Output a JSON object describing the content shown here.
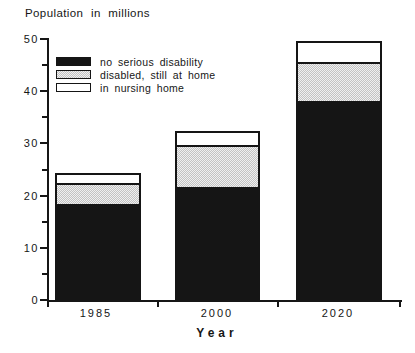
{
  "chart_data": {
    "type": "bar",
    "stacked": true,
    "title": "Population in millions",
    "xlabel": "Year",
    "categories": [
      "1985",
      "2000",
      "2020"
    ],
    "series": [
      {
        "name": "no serious disability",
        "fill": "black",
        "values": [
          18.3,
          21.7,
          38.1
        ]
      },
      {
        "name": "disabled, still at home",
        "fill": "stipple",
        "values": [
          4.1,
          8.0,
          7.4
        ]
      },
      {
        "name": "in nursing home",
        "fill": "white",
        "values": [
          1.9,
          2.7,
          4.1
        ]
      }
    ],
    "totals": [
      24.3,
      32.4,
      49.6
    ],
    "ylim": [
      0,
      50
    ],
    "yticks": [
      0,
      10,
      20,
      30,
      40,
      50
    ],
    "minor_tick_step": 5,
    "grid": false,
    "legend_position": "upper-left-inside",
    "colors": {
      "axis": "#161616",
      "bar_black": "#151515",
      "bar_stipple": "#d9d9d9",
      "bar_white": "#ffffff",
      "background": "#ffffff"
    }
  }
}
